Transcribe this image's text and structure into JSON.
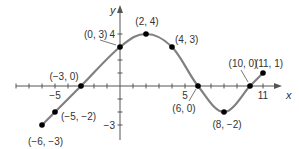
{
  "chart_data": {
    "type": "line",
    "title": "",
    "xlabel": "x",
    "ylabel": "y",
    "xlim": [
      -7.5,
      12
    ],
    "ylim": [
      -3.5,
      4.8
    ],
    "grid": false,
    "x_tick_labels": [
      {
        "value": -5,
        "label": "−5"
      },
      {
        "value": 5,
        "label": "5"
      },
      {
        "value": 11,
        "label": "11"
      }
    ],
    "y_tick_labels": [
      {
        "value": 4,
        "label": "4"
      },
      {
        "value": -3,
        "label": "−3"
      }
    ],
    "x_ticks": [
      -8,
      -7,
      -6,
      -5,
      -4,
      -3,
      -2,
      -1,
      1,
      2,
      3,
      4,
      5,
      6,
      7,
      8,
      9,
      10,
      11
    ],
    "y_ticks": [
      -3,
      -2,
      -1,
      1,
      2,
      3,
      4
    ],
    "series": [
      {
        "name": "f",
        "points": [
          {
            "x": -6,
            "y": -3,
            "label": "(−6, −3)"
          },
          {
            "x": -5,
            "y": -2,
            "label": "(−5, −2)"
          },
          {
            "x": -3,
            "y": 0,
            "label": "(−3, 0)"
          },
          {
            "x": 0,
            "y": 3,
            "label": "(0, 3)"
          },
          {
            "x": 2,
            "y": 4,
            "label": "(2, 4)"
          },
          {
            "x": 4,
            "y": 3,
            "label": "(4, 3)"
          },
          {
            "x": 6,
            "y": 0,
            "label": "(6, 0)"
          },
          {
            "x": 8,
            "y": -2,
            "label": "(8, −2)"
          },
          {
            "x": 10,
            "y": 0,
            "label": "(10, 0)"
          },
          {
            "x": 11,
            "y": 1,
            "label": "(11, 1)"
          }
        ]
      }
    ],
    "colors": {
      "curve": "#808080",
      "points": "#000000",
      "axes": "#555555",
      "text": "#333333"
    }
  }
}
